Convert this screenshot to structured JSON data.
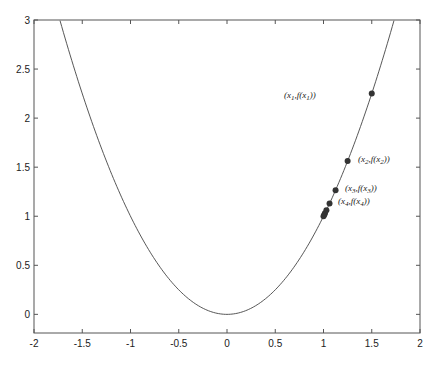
{
  "chart_data": {
    "type": "line",
    "title": "",
    "xlabel": "",
    "ylabel": "",
    "xlim": [
      -2,
      2
    ],
    "ylim": [
      -0.19,
      3
    ],
    "grid": false,
    "x_ticks": [
      -2,
      -1.5,
      -1,
      -0.5,
      0,
      0.5,
      1,
      1.5,
      2
    ],
    "x_tick_labels": [
      "-2",
      "-1.5",
      "-1",
      "-0.5",
      "0",
      "0.5",
      "1",
      "1.5",
      "2"
    ],
    "y_ticks": [
      0,
      0.5,
      1,
      1.5,
      2,
      2.5,
      3
    ],
    "y_tick_labels": [
      "0",
      "0.5",
      "1",
      "1.5",
      "2",
      "2.5",
      "3"
    ],
    "series": [
      {
        "name": "f(x) = x^2",
        "kind": "curve",
        "function": "x^2",
        "x_range": [
          -1.73,
          1.73
        ],
        "color": "#444444"
      },
      {
        "name": "iterates",
        "kind": "scatter",
        "color": "#333333",
        "x": [
          1.5,
          1.25,
          1.125,
          1.0625,
          1.03,
          1.015,
          1.008,
          1.0
        ],
        "y": [
          2.25,
          1.5625,
          1.2656,
          1.1289,
          1.061,
          1.03,
          1.016,
          1.0
        ]
      }
    ],
    "annotations": [
      {
        "text": "(x1, f(x1))",
        "x": 1.5,
        "y": 2.25,
        "side": "left"
      },
      {
        "text": "(x2, f(x2))",
        "x": 1.25,
        "y": 1.5625,
        "side": "right"
      },
      {
        "text": "(x3, f(x3))",
        "x": 1.125,
        "y": 1.2656,
        "side": "right"
      },
      {
        "text": "(x4, f(x4))",
        "x": 1.0625,
        "y": 1.1289,
        "side": "right"
      }
    ]
  },
  "labels": {
    "p1": {
      "pre": "(x",
      "sub1": "1",
      "mid": ",f(x",
      "sub2": "1",
      "post": "))"
    },
    "p2": {
      "pre": "(x",
      "sub1": "2",
      "mid": ",f(x",
      "sub2": "2",
      "post": "))"
    },
    "p3": {
      "pre": "(x",
      "sub1": "3",
      "mid": ",f(x",
      "sub2": "3",
      "post": "))"
    },
    "p4": {
      "pre": "(x",
      "sub1": "4",
      "mid": ",f(x",
      "sub2": "4",
      "post": "))"
    }
  }
}
